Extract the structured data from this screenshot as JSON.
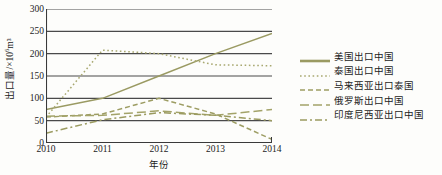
{
  "chart_data": {
    "type": "line",
    "title": "",
    "subtitle": "",
    "xlabel": "年份",
    "ylabel": "出口量/×10⁶m³",
    "ylabel_base": "出口量/×10",
    "ylabel_exp": "6",
    "ylabel_unit": "m³",
    "x": [
      2010,
      2011,
      2012,
      2013,
      2014
    ],
    "categories": [
      "2010",
      "2011",
      "2012",
      "2013",
      "2014"
    ],
    "xlim": [
      2010,
      2014
    ],
    "ylim": [
      0,
      300
    ],
    "yticks": [
      300,
      250,
      200,
      150,
      100,
      50,
      0
    ],
    "ytick_labels": [
      "300",
      "250",
      "200",
      "150",
      "100",
      "50",
      "0"
    ],
    "grid": "horizontal",
    "legend_position": "right",
    "series": [
      {
        "name": "美国出口中国",
        "style": "solid",
        "color": "#9a9a62",
        "dash": "none",
        "values": [
          75,
          100,
          150,
          200,
          245
        ]
      },
      {
        "name": "泰国出口中国",
        "style": "dotted",
        "color": "#a8a870",
        "dash": "1.6,2.6",
        "values": [
          58,
          208,
          200,
          175,
          173
        ]
      },
      {
        "name": "马来西亚出口泰国",
        "style": "dashed",
        "color": "#9d9d63",
        "dash": "5,3",
        "values": [
          58,
          65,
          100,
          65,
          8
        ]
      },
      {
        "name": "俄罗斯出口中国",
        "style": "long-dash",
        "color": "#a3a369",
        "dash": "9,4",
        "values": [
          60,
          62,
          72,
          62,
          75
        ]
      },
      {
        "name": "印度尼西亚出口中国",
        "style": "dash-dot",
        "color": "#9b9b60",
        "dash": "7,3,2,3",
        "values": [
          22,
          52,
          68,
          62,
          50
        ]
      }
    ],
    "axis_color": "#3a3a3a",
    "grid_color": "#4a4a4a",
    "background": "#fdfdfb"
  },
  "legend": {
    "items": [
      {
        "label": "美国出口中国"
      },
      {
        "label": "泰国出口中国"
      },
      {
        "label": "马来西亚出口泰国"
      },
      {
        "label": "俄罗斯出口中国"
      },
      {
        "label": "印度尼西亚出口中国"
      }
    ]
  }
}
